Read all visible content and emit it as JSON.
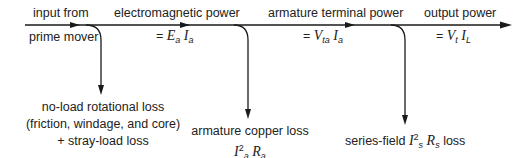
{
  "diagram": {
    "stages": [
      {
        "label": "input from",
        "sublabel": "prime mover"
      },
      {
        "label": "electromagnetic power",
        "equation": {
          "prefix": "= ",
          "v1": "E",
          "s1": "a",
          "v2": "I",
          "s2": "a"
        }
      },
      {
        "label": "armature terminal power",
        "equation": {
          "prefix": "= ",
          "v1": "V",
          "s1": "ta",
          "v2": "I",
          "s2": "a"
        }
      },
      {
        "label": "output power",
        "equation": {
          "prefix": "= ",
          "v1": "V",
          "s1": "t",
          "v2": "I",
          "s2": "L"
        }
      }
    ],
    "losses": [
      {
        "line1": "no-load rotational loss",
        "line2": "(friction, windage, and core)",
        "line3": "+ stray-load loss"
      },
      {
        "line1": "armature copper loss",
        "line2": {
          "v1": "I",
          "sup": "2",
          "s1": "a",
          "v2": "R",
          "s2": "a"
        },
        "line3": "+ brush-contact loss"
      },
      {
        "line1": {
          "prefix": "series-field ",
          "v1": "I",
          "sup": "2",
          "s1": "s",
          "v2": "R",
          "s2": "s",
          "suffix": " loss"
        },
        "line2": {
          "prefix": "+ shunt-field ",
          "v1": "I",
          "sup": "2",
          "s1": "f",
          "v2": "R",
          "s2": "f",
          "suffix": " loss"
        }
      }
    ]
  }
}
